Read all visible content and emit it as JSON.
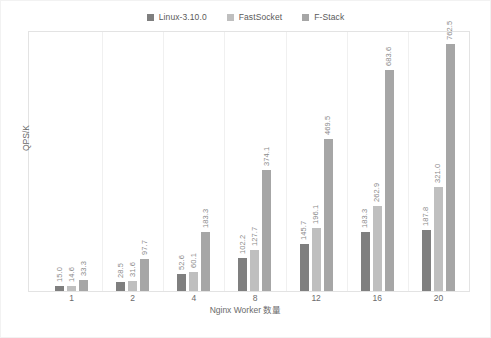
{
  "chart_data": {
    "type": "bar",
    "title": "",
    "subtitle": "",
    "xlabel": "Nginx Worker 数量",
    "ylabel": "QPS/K",
    "categories": [
      "1",
      "2",
      "4",
      "8",
      "12",
      "16",
      "20"
    ],
    "series": [
      {
        "name": "Linux-3.10.0",
        "color": "#7f7f7f",
        "values": [
          15.0,
          28.5,
          52.6,
          102.2,
          145.7,
          183.3,
          187.8
        ],
        "labels": [
          "15.0",
          "28.5",
          "52.6",
          "102.2",
          "145.7",
          "183.3",
          "187.8"
        ]
      },
      {
        "name": "FastSocket",
        "color": "#bfbfbf",
        "values": [
          14.6,
          31.6,
          60.1,
          127.7,
          196.1,
          262.9,
          321.0
        ],
        "labels": [
          "14.6",
          "31.6",
          "60.1",
          "127.7",
          "196.1",
          "262.9",
          "321.0"
        ]
      },
      {
        "name": "F-Stack",
        "color": "#a6a6a6",
        "values": [
          33.3,
          97.7,
          183.3,
          374.1,
          469.5,
          683.6,
          762.5
        ],
        "labels": [
          "33.3",
          "97.7",
          "183.3",
          "374.1",
          "469.5",
          "683.6",
          "762.5"
        ]
      }
    ],
    "ylim": [
      0,
      800
    ],
    "grid": false,
    "legend_position": "top",
    "data_labels_rotated": true
  },
  "legend": {
    "entries": [
      {
        "label": "Linux-3.10.0",
        "color": "#7f7f7f"
      },
      {
        "label": "FastSocket",
        "color": "#bfbfbf"
      },
      {
        "label": "F-Stack",
        "color": "#a6a6a6"
      }
    ]
  },
  "axes": {
    "y_title": "QPS/K",
    "x_title": "Nginx Worker 数量",
    "x_ticks": [
      "1",
      "2",
      "4",
      "8",
      "12",
      "16",
      "20"
    ]
  },
  "colors": {
    "series_1": "#7f7f7f",
    "series_2": "#bfbfbf",
    "series_3": "#a6a6a6",
    "plot_border": "#e3e3e3",
    "text": "#6b6b6b",
    "label_text": "#8a8a8a",
    "background": "#ffffff"
  }
}
